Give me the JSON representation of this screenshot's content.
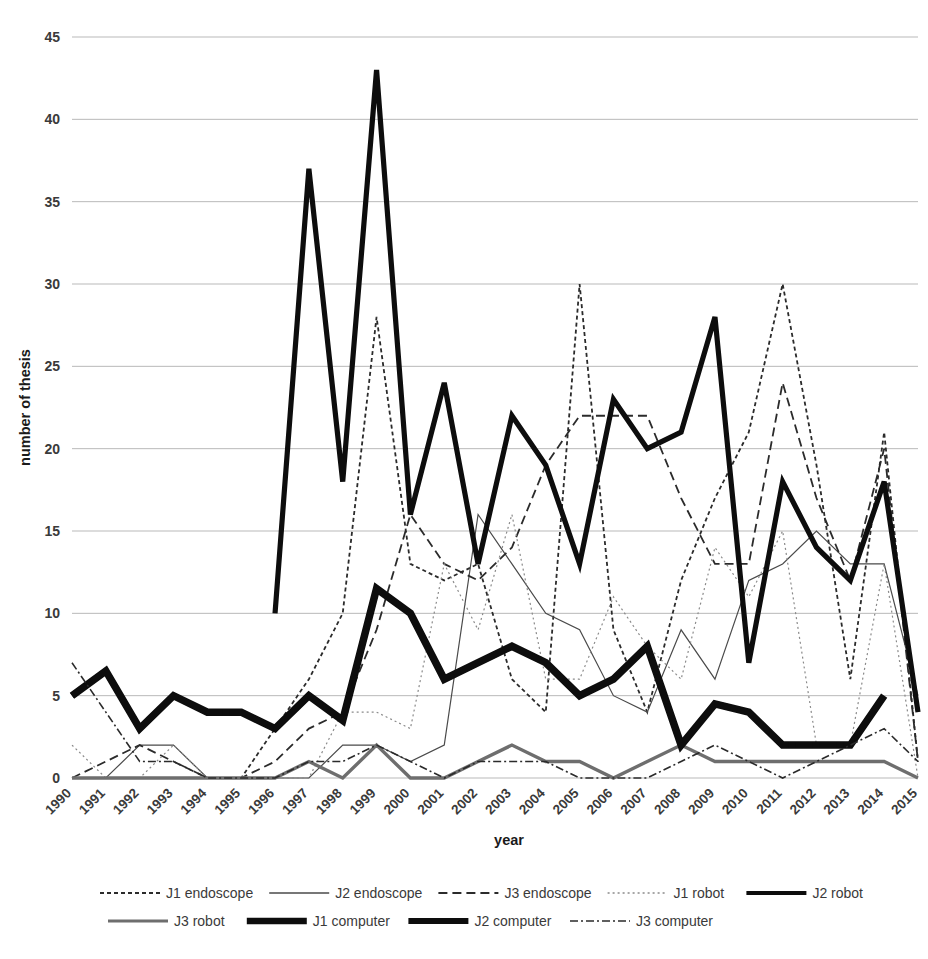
{
  "chart_data": {
    "type": "line",
    "title": "",
    "xlabel": "year",
    "ylabel": "number of thesis",
    "grid": true,
    "legend_position": "bottom",
    "xlim": [
      1990,
      2015
    ],
    "ylim": [
      0,
      45
    ],
    "ytick_labels": [
      "0",
      "5",
      "10",
      "15",
      "20",
      "25",
      "30",
      "35",
      "40",
      "45"
    ],
    "yticks": [
      0,
      5,
      10,
      15,
      20,
      25,
      30,
      35,
      40,
      45
    ],
    "categories": [
      "1990",
      "1991",
      "1992",
      "1993",
      "1994",
      "1995",
      "1996",
      "1997",
      "1998",
      "1999",
      "2000",
      "2001",
      "2002",
      "2003",
      "2004",
      "2005",
      "2006",
      "2007",
      "2008",
      "2009",
      "2010",
      "2011",
      "2012",
      "2013",
      "2014",
      "2015"
    ],
    "series": [
      {
        "name": "J1 endoscope",
        "style": "dotted",
        "color": "#2b2b2b",
        "width": 1.8,
        "dash": "4,3",
        "values": [
          0,
          0,
          0,
          0,
          0,
          0,
          3,
          6,
          10,
          28,
          13,
          12,
          13,
          6,
          4,
          30,
          9,
          4,
          12,
          17,
          21,
          30,
          19,
          6,
          21,
          1
        ]
      },
      {
        "name": "J2 endoscope",
        "style": "solid-thin",
        "color": "#4a4a4a",
        "width": 1.2,
        "dash": "none",
        "values": [
          0,
          0,
          2,
          2,
          0,
          0,
          0,
          0,
          2,
          2,
          1,
          2,
          16,
          13,
          10,
          9,
          5,
          4,
          9,
          6,
          12,
          13,
          15,
          13,
          13,
          5
        ]
      },
      {
        "name": "J3 endoscope",
        "style": "dashed",
        "color": "#2b2b2b",
        "width": 1.8,
        "dash": "9,5",
        "values": [
          0,
          1,
          2,
          1,
          0,
          0,
          1,
          3,
          4,
          9,
          16,
          13,
          12,
          14,
          19,
          22,
          22,
          22,
          17,
          13,
          13,
          24,
          17,
          12,
          20,
          1
        ]
      },
      {
        "name": "J1 robot",
        "style": "dotted-light",
        "color": "#8a8a8a",
        "width": 1.2,
        "dash": "2,3",
        "values": [
          2,
          0,
          0,
          2,
          0,
          0,
          0,
          0,
          4,
          4,
          3,
          13,
          9,
          16,
          6,
          6,
          11,
          8,
          6,
          14,
          11,
          15,
          2,
          2,
          13,
          0
        ]
      },
      {
        "name": "J2 robot",
        "style": "solid-thick",
        "color": "#0d0d0d",
        "width": 5.2,
        "dash": "none",
        "values": [
          null,
          null,
          null,
          null,
          null,
          null,
          10,
          37,
          18,
          43,
          16,
          24,
          13,
          22,
          19,
          13,
          23,
          20,
          21,
          28,
          7,
          18,
          14,
          12,
          18,
          4
        ]
      },
      {
        "name": "J3 robot",
        "style": "solid-medium",
        "color": "#6e6e6e",
        "width": 3.4,
        "dash": "none",
        "values": [
          0,
          0,
          0,
          0,
          0,
          0,
          0,
          1,
          0,
          2,
          0,
          0,
          1,
          2,
          1,
          1,
          0,
          1,
          2,
          1,
          1,
          1,
          1,
          1,
          1,
          0
        ]
      },
      {
        "name": "J1 computer",
        "style": "solid-verythick",
        "color": "#0d0d0d",
        "width": 7.5,
        "dash": "none",
        "values": [
          5,
          6.5,
          3,
          5,
          4,
          4,
          3,
          5,
          3.5,
          11.5,
          10,
          6,
          7,
          8,
          7,
          5,
          6,
          8,
          2,
          4.5,
          4,
          2,
          2,
          2,
          5,
          null
        ]
      },
      {
        "name": "J2 computer",
        "style": "dash-thick",
        "color": "#0d0d0d",
        "width": 6.0,
        "dash": "none",
        "values": [
          5,
          6.5,
          3,
          5,
          4,
          4,
          3,
          5,
          3.5,
          11.5,
          10,
          6,
          7,
          8,
          7,
          5,
          6,
          8,
          2,
          4.5,
          4,
          2,
          2,
          2,
          5,
          null
        ]
      },
      {
        "name": "J3 computer",
        "style": "dashdot",
        "color": "#2b2b2b",
        "width": 1.6,
        "dash": "8,3,2,3",
        "values": [
          7,
          4,
          1,
          1,
          0,
          0,
          0,
          1,
          1,
          2,
          1,
          0,
          1,
          1,
          1,
          0,
          0,
          0,
          1,
          2,
          1,
          0,
          1,
          2,
          3,
          1
        ]
      }
    ]
  },
  "legend": {
    "row1": [
      {
        "label": "J1 endoscope",
        "swatch": "dotted"
      },
      {
        "label": "J2 endoscope",
        "swatch": "solid-thin"
      },
      {
        "label": "J3 endoscope",
        "swatch": "dashed"
      },
      {
        "label": "J1 robot",
        "swatch": "dotted-light"
      },
      {
        "label": "J2 robot",
        "swatch": "solid-thick"
      }
    ],
    "row2": [
      {
        "label": "J3 robot",
        "swatch": "solid-medium"
      },
      {
        "label": "J1 computer",
        "swatch": "solid-verythick"
      },
      {
        "label": "J2 computer",
        "swatch": "dash-thick"
      },
      {
        "label": "J3 computer",
        "swatch": "dashdot"
      }
    ]
  }
}
